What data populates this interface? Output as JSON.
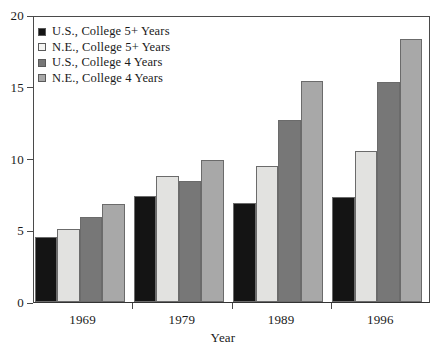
{
  "chart_data": {
    "type": "bar",
    "title": "",
    "subtitle": "",
    "xlabel": "Year",
    "ylabel": "",
    "categories": [
      "1969",
      "1979",
      "1989",
      "1996"
    ],
    "ylim": [
      0,
      20
    ],
    "yticks": [
      0,
      5,
      10,
      15,
      20
    ],
    "ytick_labels": [
      "0",
      "5",
      "10",
      "15",
      "20"
    ],
    "grid": false,
    "legend_position": "top-left",
    "series": [
      {
        "name": "U.S., College 5+ Years",
        "color": "#141414",
        "values": [
          4.5,
          7.4,
          6.9,
          7.3
        ]
      },
      {
        "name": "N.E., College 5+ Years",
        "color": "#e2e2e0",
        "values": [
          5.1,
          8.8,
          9.5,
          10.5
        ]
      },
      {
        "name": "U.S., College 4 Years",
        "color": "#777777",
        "values": [
          5.9,
          8.4,
          12.7,
          15.3
        ]
      },
      {
        "name": "N.E., College 4 Years",
        "color": "#a8a8a8",
        "values": [
          6.8,
          9.9,
          15.4,
          18.3
        ]
      }
    ]
  },
  "axis": {
    "x_title": "Year"
  },
  "legend": {
    "items": [
      {
        "label": "U.S., College 5+ Years",
        "swatch": "#141414"
      },
      {
        "label": "N.E., College 5+ Years",
        "swatch": "#f4f4f2"
      },
      {
        "label": "U.S., College 4 Years",
        "swatch": "#777777"
      },
      {
        "label": "N.E., College 4 Years",
        "swatch": "#a8a8a8"
      }
    ]
  }
}
